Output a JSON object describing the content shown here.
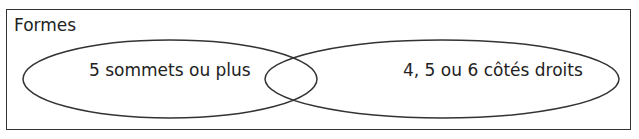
{
  "diagram": {
    "title": "Formes",
    "sets": [
      {
        "label": "5 sommets ou plus"
      },
      {
        "label": "4, 5 ou 6 côtés droits"
      }
    ]
  }
}
